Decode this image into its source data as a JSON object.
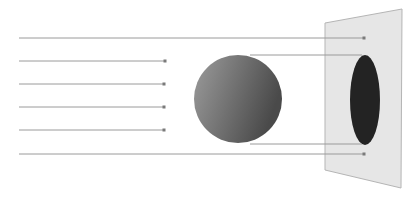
{
  "diagram": {
    "title": "",
    "colors": {
      "background": "#ffffff",
      "ray": "#9a9a9a",
      "arrowhead": "#7a7a7a",
      "sphere_light": "#9c9c9c",
      "sphere_dark": "#4a4a4a",
      "plane_fill": "#e6e6e6",
      "plane_edge": "#b5b5b5",
      "shadow": "#232323"
    },
    "rays": [
      {
        "id": "ray-1",
        "y": 38,
        "x_start": 19,
        "x_end": 364,
        "passes_sphere": true
      },
      {
        "id": "ray-2",
        "y": 61,
        "x_start": 19,
        "x_end": 165,
        "passes_sphere": false
      },
      {
        "id": "ray-3",
        "y": 84,
        "x_start": 19,
        "x_end": 164,
        "passes_sphere": false
      },
      {
        "id": "ray-4",
        "y": 107,
        "x_start": 19,
        "x_end": 164,
        "passes_sphere": false
      },
      {
        "id": "ray-5",
        "y": 130,
        "x_start": 19,
        "x_end": 164,
        "passes_sphere": false
      },
      {
        "id": "ray-6",
        "y": 154,
        "x_start": 19,
        "x_end": 364,
        "passes_sphere": true
      }
    ],
    "tangent_rays": [
      {
        "id": "tangent-top",
        "y": 55,
        "x_start": 250,
        "x_end": 362
      },
      {
        "id": "tangent-bottom",
        "y": 144,
        "x_start": 250,
        "x_end": 362
      }
    ],
    "sphere": {
      "cx": 238,
      "cy": 99,
      "r": 44
    },
    "plane": {
      "points": "325,23 402,9 401,188 325,170"
    },
    "shadow": {
      "cx": 365,
      "cy": 100,
      "rx": 15,
      "ry": 45
    }
  }
}
